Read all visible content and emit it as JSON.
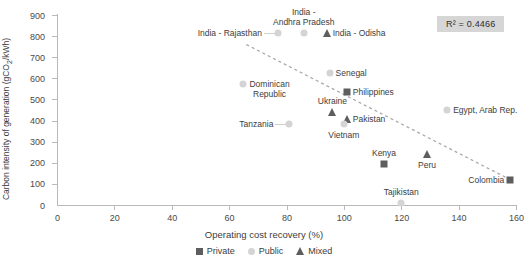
{
  "chart_data": {
    "type": "scatter",
    "title": "",
    "xlabel": "Operating cost recovery (%)",
    "ylabel": "Carbon intensity of generation (gCO2/kWh)",
    "xlim": [
      0,
      160
    ],
    "ylim": [
      0,
      900
    ],
    "xticks": [
      0,
      20,
      40,
      60,
      80,
      100,
      120,
      140,
      160
    ],
    "yticks": [
      0,
      100,
      200,
      300,
      400,
      500,
      600,
      700,
      800,
      900
    ],
    "grid": false,
    "legend_position": "bottom-center",
    "annotations": [
      {
        "name": "r2-annotation",
        "text": "R² = 0.4466",
        "value": 0.4466
      }
    ],
    "trendline": {
      "type": "linear-dashed",
      "x_start": 66,
      "y_start": 760,
      "x_end": 158,
      "y_end": 120
    },
    "series": [
      {
        "name": "Private",
        "marker": "square",
        "color": "#5e5e5e"
      },
      {
        "name": "Public",
        "marker": "circle",
        "color": "#d4d4d4"
      },
      {
        "name": "Mixed",
        "marker": "triangle",
        "color": "#5e5e5e"
      }
    ],
    "points": [
      {
        "label": "India - Rajasthan",
        "x": 77,
        "y": 815,
        "series": "Public",
        "label_pos": "left",
        "leader": true
      },
      {
        "label": "India -\nAndhra Pradesh",
        "x": 86,
        "y": 815,
        "series": "Public",
        "label_pos": "top"
      },
      {
        "label": "India - Odisha",
        "x": 94,
        "y": 815,
        "series": "Mixed",
        "label_pos": "right"
      },
      {
        "label": "Senegal",
        "x": 95,
        "y": 625,
        "series": "Public",
        "label_pos": "right"
      },
      {
        "label": "Philippines",
        "x": 101,
        "y": 535,
        "series": "Private",
        "label_pos": "right"
      },
      {
        "label": "Dominican\nRepublic",
        "x": 65,
        "y": 575,
        "series": "Public",
        "label_pos": "right"
      },
      {
        "label": "Ukraine",
        "x": 96,
        "y": 440,
        "series": "Mixed",
        "label_pos": "top"
      },
      {
        "label": "Pakistan",
        "x": 101,
        "y": 408,
        "series": "Mixed",
        "label_pos": "right"
      },
      {
        "label": "Egypt, Arab Rep.",
        "x": 136,
        "y": 450,
        "series": "Public",
        "label_pos": "right"
      },
      {
        "label": "Tanzania",
        "x": 81,
        "y": 385,
        "series": "Public",
        "label_pos": "left",
        "leader": true
      },
      {
        "label": "Vietnam",
        "x": 100,
        "y": 385,
        "series": "Public",
        "label_pos": "bottom"
      },
      {
        "label": "Kenya",
        "x": 114,
        "y": 195,
        "series": "Private",
        "label_pos": "top"
      },
      {
        "label": "Peru",
        "x": 129,
        "y": 240,
        "series": "Mixed",
        "label_pos": "bottom"
      },
      {
        "label": "Colombia",
        "x": 158,
        "y": 120,
        "series": "Private",
        "label_pos": "left"
      },
      {
        "label": "Tajikistan",
        "x": 120,
        "y": 10,
        "series": "Public",
        "label_pos": "top"
      }
    ]
  },
  "axis": {
    "y_title_prefix": "Carbon intensity of generation (gCO",
    "y_title_sub": "2",
    "y_title_suffix": "/kWh)",
    "x_title": "Operating cost recovery (%)"
  },
  "legend": {
    "items": [
      {
        "label": "Private"
      },
      {
        "label": "Public"
      },
      {
        "label": "Mixed"
      }
    ]
  },
  "r2": {
    "text": "R² = 0.4466"
  }
}
